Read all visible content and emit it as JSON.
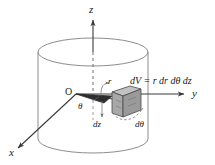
{
  "figure": {
    "background_color": "#ffffff",
    "line_color": "#555555",
    "axis_color": "#3a3a3a",
    "wedge_fill": "#b0b0b0",
    "wedge_edge": "#4a4a4a"
  },
  "axes": {
    "z_label": "z",
    "y_label": "y",
    "x_label": "x",
    "origin_label": "O"
  },
  "labels": {
    "radius": "r",
    "theta": "θ",
    "dz": "dz",
    "dtheta": "dθ"
  },
  "formula": {
    "text": "dV = r dr dθ dz",
    "lhs": "dV",
    "equals": "=",
    "rhs": "r dr dθ dz"
  },
  "geometry": {
    "cylinder": {
      "center_x": 93,
      "top_ellipse_cy": 52,
      "bottom_ellipse_cy": 139,
      "rx": 55,
      "ry": 14
    },
    "origin": {
      "x": 76,
      "y": 94
    },
    "z_axis": {
      "x": 93,
      "top_y": 18,
      "bottom_y": 139
    },
    "y_axis": {
      "x1": 76,
      "y1": 94,
      "x2": 186,
      "y2": 94
    },
    "x_axis": {
      "x1": 76,
      "y1": 94,
      "x2": 16,
      "y2": 150
    }
  }
}
